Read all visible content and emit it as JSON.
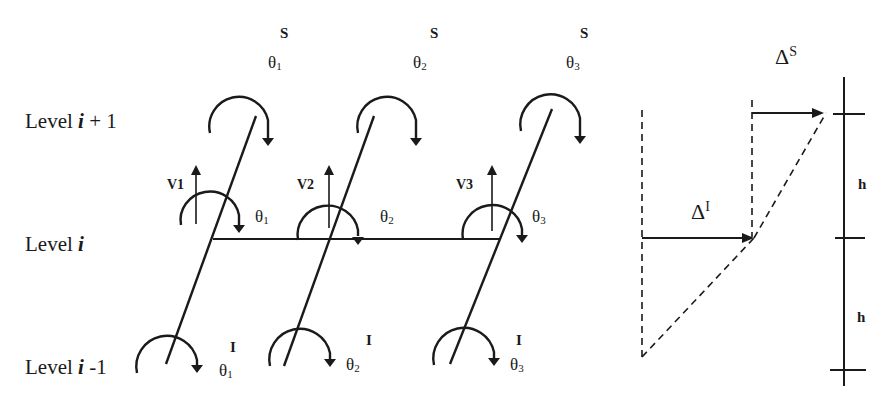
{
  "levels": {
    "upper": {
      "prefix": "Level ",
      "var": "i",
      "suffix": " + 1"
    },
    "middle": {
      "prefix": "Level ",
      "var": "i",
      "suffix": ""
    },
    "lower": {
      "prefix": "Level ",
      "var": "i",
      "suffix": " -1"
    }
  },
  "top_rotations": [
    {
      "sup": "S",
      "symbol": "θ",
      "sub": "1"
    },
    {
      "sup": "S",
      "symbol": "θ",
      "sub": "2"
    },
    {
      "sup": "S",
      "symbol": "θ",
      "sub": "3"
    }
  ],
  "mid_rotations": [
    {
      "symbol": "θ",
      "sub": "1"
    },
    {
      "symbol": "θ",
      "sub": "2"
    },
    {
      "symbol": "θ",
      "sub": "3"
    }
  ],
  "bottom_rotations": [
    {
      "sup": "I",
      "symbol": "θ",
      "sub": "1"
    },
    {
      "sup": "I",
      "symbol": "θ",
      "sub": "2"
    },
    {
      "sup": "I",
      "symbol": "θ",
      "sub": "3"
    }
  ],
  "shear_forces": [
    "V1",
    "V2",
    "V3"
  ],
  "displacements": {
    "upper": {
      "symbol": "Δ",
      "sup": "S"
    },
    "lower": {
      "symbol": "Δ",
      "sup": "I"
    }
  },
  "story_heights": [
    "h",
    "h"
  ],
  "colors": {
    "ink": "#1a1a1a",
    "background": "#ffffff"
  }
}
